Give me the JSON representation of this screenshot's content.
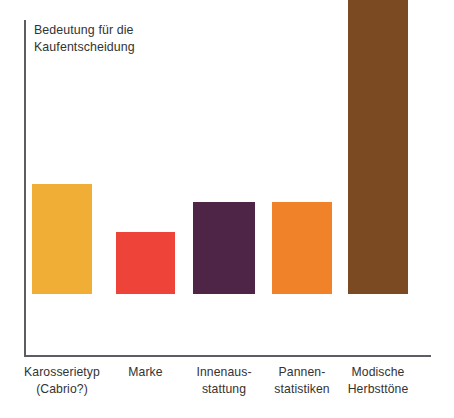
{
  "chart": {
    "axis_title": "Bedeutung für die\nKaufentscheidung",
    "axis_color": "#5c5c64",
    "background": "#ffffff"
  },
  "chart_data": {
    "type": "bar",
    "title": "",
    "ylabel": "Bedeutung für die Kaufentscheidung",
    "xlabel": "",
    "grid": false,
    "legend": "none",
    "ylim": [
      0,
      105
    ],
    "categories": [
      "Karosserietyp\n(Cabrio?)",
      "Marke",
      "Innenaus-\nstattung",
      "Pannen-\nstatistiken",
      "Modische\nHerbsttöne"
    ],
    "values": [
      33,
      19,
      28,
      28,
      100
    ],
    "colors": [
      "#F0AE36",
      "#EE4338",
      "#4E2447",
      "#F08229",
      "#7B4A22"
    ],
    "bars": [
      {
        "label": "Karosserietyp\n(Cabrio?)",
        "value": 33,
        "color": "#F0AE36",
        "left": 32,
        "width": 60,
        "height_px": 110
      },
      {
        "label": "Marke",
        "value": 19,
        "color": "#EE4338",
        "left": 116,
        "width": 59,
        "height_px": 62
      },
      {
        "label": "Innenaus-\nstattung",
        "value": 28,
        "color": "#4E2447",
        "left": 193,
        "width": 62,
        "height_px": 92
      },
      {
        "label": "Pannen-\nstatistiken",
        "value": 28,
        "color": "#F08229",
        "left": 272,
        "width": 60,
        "height_px": 92
      },
      {
        "label": "Modische\nHerbsttöne",
        "value": 100,
        "color": "#7B4A22",
        "left": 348,
        "width": 60,
        "height_px": 329
      }
    ]
  }
}
